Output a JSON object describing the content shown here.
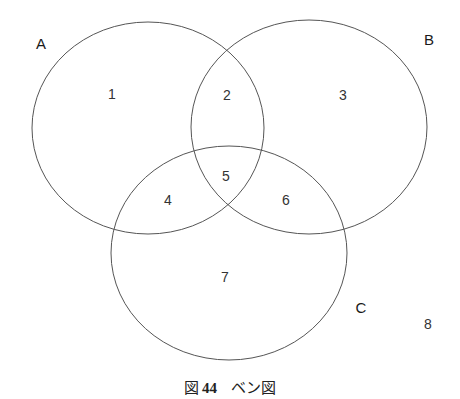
{
  "header_fragment": "",
  "diagram": {
    "type": "venn",
    "stroke_color": "#555555",
    "sets": [
      {
        "name": "A",
        "label": "A",
        "cx": 148,
        "cy": 128,
        "rx": 116,
        "ry": 106,
        "label_x": 41,
        "label_y": 43
      },
      {
        "name": "B",
        "label": "B",
        "cx": 309,
        "cy": 127,
        "rx": 118,
        "ry": 107,
        "label_x": 429,
        "label_y": 39
      },
      {
        "name": "C",
        "label": "C",
        "cx": 229,
        "cy": 253,
        "rx": 118,
        "ry": 107,
        "label_x": 361,
        "label_y": 307
      }
    ],
    "regions": [
      {
        "id": "1",
        "label": "1",
        "x": 112,
        "y": 94
      },
      {
        "id": "2",
        "label": "2",
        "x": 227,
        "y": 95
      },
      {
        "id": "3",
        "label": "3",
        "x": 343,
        "y": 95
      },
      {
        "id": "4",
        "label": "4",
        "x": 168,
        "y": 200
      },
      {
        "id": "5",
        "label": "5",
        "x": 226,
        "y": 176
      },
      {
        "id": "6",
        "label": "6",
        "x": 286,
        "y": 200
      },
      {
        "id": "7",
        "label": "7",
        "x": 225,
        "y": 277
      },
      {
        "id": "8",
        "label": "8",
        "x": 428,
        "y": 324
      }
    ]
  },
  "caption": {
    "prefix": "図",
    "number": "44",
    "title": "ベン図"
  }
}
